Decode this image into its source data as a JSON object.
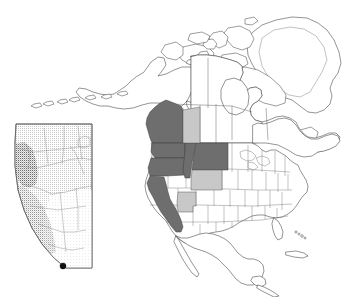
{
  "figure": {
    "kind": "map",
    "background_color": "#ffffff",
    "width": 357,
    "height": 297
  },
  "legend_colors": {
    "highlight_dark": "#6e6e6e",
    "highlight_light": "#c8c8c8",
    "land_fill": "#ffffff",
    "coast_outline": "#3c3c3c",
    "border_outline": "#555555",
    "point_marker": "#111111",
    "inset_shade_dark": "#9a9a9a",
    "inset_shade_mid": "#bcbcbc",
    "inset_shade_light": "#e4e4e4"
  },
  "main_map": {
    "name": "north-america-outline",
    "projection_note": "conic",
    "landmasses": [
      {
        "id": "alaska",
        "label": "Alaska",
        "fill": "land"
      },
      {
        "id": "aleutians",
        "label": "Aleutian Islands",
        "fill": "land"
      },
      {
        "id": "canada",
        "label": "Canada",
        "fill": "land"
      },
      {
        "id": "greenland",
        "label": "Greenland",
        "fill": "land"
      },
      {
        "id": "arctic-islands",
        "label": "Canadian Arctic Archipelago",
        "fill": "land"
      },
      {
        "id": "usa",
        "label": "United States",
        "fill": "land"
      },
      {
        "id": "mexico",
        "label": "Mexico",
        "fill": "land"
      },
      {
        "id": "hawaii",
        "label": "Hawaii",
        "fill": "land"
      }
    ],
    "highlighted_dark": [
      {
        "id": "british-columbia",
        "label": "British Columbia",
        "shade": "dark"
      },
      {
        "id": "washington",
        "label": "Washington",
        "shade": "dark"
      },
      {
        "id": "oregon",
        "label": "Oregon",
        "shade": "dark"
      },
      {
        "id": "idaho",
        "label": "Idaho",
        "shade": "dark"
      },
      {
        "id": "montana",
        "label": "Montana",
        "shade": "dark"
      },
      {
        "id": "california",
        "label": "California",
        "shade": "dark"
      }
    ],
    "highlighted_light": [
      {
        "id": "alberta",
        "label": "Alberta",
        "shade": "light"
      },
      {
        "id": "wyoming",
        "label": "Wyoming",
        "shade": "light"
      },
      {
        "id": "utah",
        "label": "Utah",
        "shade": "light"
      }
    ]
  },
  "inset_map": {
    "name": "alberta-inset",
    "label": "Alberta",
    "border_color": "#5e5e5e",
    "texture": "stippled",
    "marker": {
      "label": "locality point",
      "shape": "filled-circle",
      "color": "#111111",
      "x_pct": 57,
      "y_pct": 94
    },
    "shading_regions": [
      {
        "id": "west-highland",
        "shade": "dark"
      },
      {
        "id": "central-plain",
        "shade": "mid"
      },
      {
        "id": "south-east-plain",
        "shade": "light"
      }
    ]
  }
}
